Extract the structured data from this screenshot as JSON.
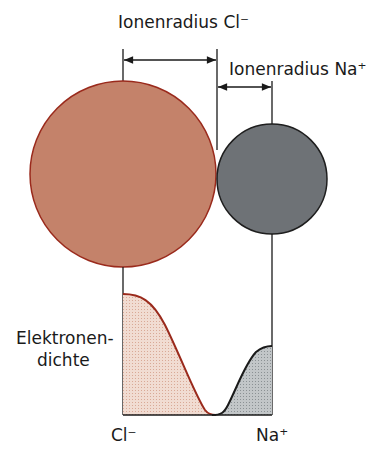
{
  "labels": {
    "radius_cl": "Ionenradius Cl⁻",
    "radius_na": "Ionenradius Na⁺",
    "density_line1": "Elektronen-",
    "density_line2": "dichte",
    "axis_cl": "Cl⁻",
    "axis_na": "Na⁺"
  },
  "colors": {
    "chloride_fill": "#c4826a",
    "chloride_stroke": "#9a2a1c",
    "sodium_fill": "#6e7276",
    "sodium_stroke": "#1e1e1e",
    "chloride_density_fill": "#ecd4c8",
    "sodium_density_fill": "#b9bec0"
  },
  "ions": [
    {
      "name": "Cl⁻",
      "role": "chloride-ion",
      "relative_radius": 93
    },
    {
      "name": "Na⁺",
      "role": "sodium-ion",
      "relative_radius": 55
    }
  ]
}
